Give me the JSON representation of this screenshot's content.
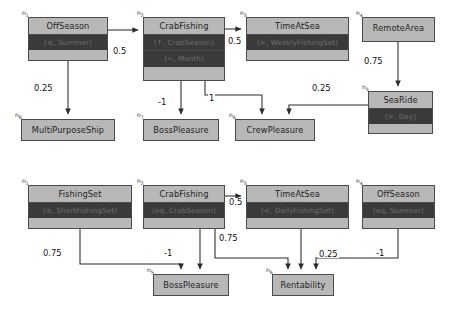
{
  "diagrams": [
    {
      "name": "top-diagram",
      "nodes": [
        {
          "id": "n1",
          "label": "OffSeason",
          "cond": [
            "(≤, Summer)"
          ],
          "x": 28,
          "y": 17,
          "w": 80,
          "h": 44
        },
        {
          "id": "n2",
          "label": "CrabFishing",
          "cond": [
            "(↑, CrabSeason)",
            "(=, Month)"
          ],
          "x": 143,
          "y": 17,
          "w": 82,
          "h": 64
        },
        {
          "id": "n3",
          "label": "TimeAtSea",
          "cond": [
            "(>, WeeklyFishingSet)"
          ],
          "x": 246,
          "y": 17,
          "w": 103,
          "h": 44
        },
        {
          "id": "n4",
          "label": "RemoteArea",
          "cond": [],
          "x": 362,
          "y": 17,
          "w": 73,
          "h": 25
        },
        {
          "id": "n5",
          "label": "SeaRide",
          "cond": [
            "(>, Day)"
          ],
          "x": 368,
          "y": 91,
          "w": 65,
          "h": 43
        },
        {
          "id": "n6",
          "label": "CrewPleasure",
          "cond": [],
          "x": 235,
          "y": 119,
          "w": 80,
          "h": 22
        },
        {
          "id": "n7",
          "label": "BossPleasure",
          "cond": [],
          "x": 143,
          "y": 119,
          "w": 76,
          "h": 22
        },
        {
          "id": "n8",
          "label": "MultiPurposeShip",
          "cond": [],
          "x": 21,
          "y": 119,
          "w": 94,
          "h": 22
        }
      ],
      "edges": [
        {
          "from": "n1",
          "to": "n2",
          "weight": "0.5"
        },
        {
          "from": "n2",
          "to": "n3",
          "weight": "0.5"
        },
        {
          "from": "n1",
          "to": "n8",
          "weight": "0.25"
        },
        {
          "from": "n2",
          "to": "n7",
          "weight": "-1"
        },
        {
          "from": "n2",
          "to": "n6",
          "weight": "1"
        },
        {
          "from": "n5",
          "to": "n6",
          "weight": "0.25"
        },
        {
          "from": "n4",
          "to": "n5",
          "weight": "0.75"
        }
      ]
    },
    {
      "name": "bottom-diagram",
      "nodes": [
        {
          "id": "n1",
          "label": "FishingSet",
          "cond": [
            "(≤, ShortFishingSet)"
          ],
          "x": 28,
          "y": 185,
          "w": 104,
          "h": 44
        },
        {
          "id": "n2",
          "label": "CrabFishing",
          "cond": [
            "(eq, CrabSeason)"
          ],
          "x": 143,
          "y": 185,
          "w": 82,
          "h": 44
        },
        {
          "id": "n3",
          "label": "TimeAtSea",
          "cond": [
            "(<, DailyFishingSet)"
          ],
          "x": 246,
          "y": 185,
          "w": 103,
          "h": 44
        },
        {
          "id": "n4",
          "label": "OffSeason",
          "cond": [
            "(eq, Summer)"
          ],
          "x": 362,
          "y": 185,
          "w": 73,
          "h": 44
        },
        {
          "id": "n5",
          "label": "BossPleasure",
          "cond": [],
          "x": 153,
          "y": 274,
          "w": 76,
          "h": 22
        },
        {
          "id": "n6",
          "label": "Rentability",
          "cond": [],
          "x": 272,
          "y": 274,
          "w": 62,
          "h": 22
        }
      ],
      "edges": [
        {
          "from": "n2",
          "to": "n3",
          "weight": "0.5"
        },
        {
          "from": "n1",
          "to": "n5",
          "weight": "0.75"
        },
        {
          "from": "n2",
          "to": "n5",
          "weight": "-1"
        },
        {
          "from": "n2",
          "to": "n6",
          "weight": "0.75"
        },
        {
          "from": "n3",
          "to": "n6",
          "weight": ""
        },
        {
          "from": "n4",
          "to": "n6",
          "weight": "-1"
        },
        {
          "from": "n6extra",
          "to": "n6",
          "weight": "0.25"
        }
      ]
    }
  ],
  "colors": {
    "node_header": "#b8b8b8",
    "node_condition": "#3a3a3a",
    "condition_text": "#6f6f6f",
    "border": "#4a4a4a",
    "edge": "#2b2b2b",
    "background": "#ffffff"
  },
  "labels": {
    "top": {
      "n1": "n1",
      "n2": "n2",
      "n3": "n3",
      "n4": "n4",
      "n5": "n5",
      "n6": "n6",
      "n7": "n7",
      "n8": "n8",
      "w_n1_n2": "0.5",
      "w_n2_n3": "0.5",
      "w_n1_n8": "0.25",
      "w_n2_n7": "-1",
      "w_n2_n6": "1",
      "w_n5_n6": "0.25",
      "w_n4_n5": "0.75"
    },
    "bottom": {
      "n1": "n1",
      "n2": "n2",
      "n3": "n3",
      "n4": "n4",
      "n5": "n5",
      "n6": "n6",
      "w_n2_n3": "0.5",
      "w_n1_n5": "0.75",
      "w_n2_n5": "-1",
      "w_n2_n6": "0.75",
      "w_n4_n6": "-1",
      "w_extra_n6": "0.25"
    }
  }
}
